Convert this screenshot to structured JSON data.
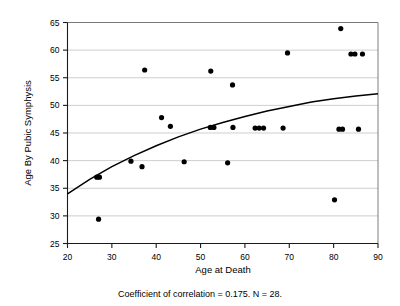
{
  "chart_data": {
    "type": "scatter",
    "title": "",
    "xlabel": "Age at Death",
    "ylabel": "Age By Pubic Symphysis",
    "xlim": [
      20,
      90
    ],
    "ylim": [
      25,
      65
    ],
    "xticks": [
      20,
      30,
      40,
      50,
      60,
      70,
      80,
      90
    ],
    "yticks": [
      25,
      30,
      35,
      40,
      45,
      50,
      55,
      60,
      65
    ],
    "xtick_labels": [
      "20",
      "30",
      "40",
      "50",
      "60",
      "70",
      "80",
      "90"
    ],
    "ytick_labels": [
      "25",
      "30",
      "35",
      "40",
      "45",
      "50",
      "55",
      "60",
      "65"
    ],
    "grid": "horizontal",
    "legend": "none",
    "n_points": 28,
    "correlation": 0.175,
    "caption": "Coefficient of correlation = 0.175. N = 28.",
    "points": [
      {
        "x": 26.6,
        "y": 37.0
      },
      {
        "x": 27.2,
        "y": 37.0
      },
      {
        "x": 27.0,
        "y": 29.4
      },
      {
        "x": 34.3,
        "y": 39.9
      },
      {
        "x": 36.8,
        "y": 38.9
      },
      {
        "x": 37.4,
        "y": 56.4
      },
      {
        "x": 41.2,
        "y": 47.8
      },
      {
        "x": 43.2,
        "y": 46.2
      },
      {
        "x": 46.3,
        "y": 39.8
      },
      {
        "x": 52.3,
        "y": 56.2
      },
      {
        "x": 52.2,
        "y": 46.0
      },
      {
        "x": 53.0,
        "y": 46.0
      },
      {
        "x": 56.1,
        "y": 39.6
      },
      {
        "x": 57.2,
        "y": 53.7
      },
      {
        "x": 57.3,
        "y": 46.0
      },
      {
        "x": 62.3,
        "y": 45.9
      },
      {
        "x": 63.2,
        "y": 45.9
      },
      {
        "x": 64.2,
        "y": 45.9
      },
      {
        "x": 68.6,
        "y": 45.9
      },
      {
        "x": 69.6,
        "y": 59.5
      },
      {
        "x": 80.2,
        "y": 32.9
      },
      {
        "x": 81.2,
        "y": 45.7
      },
      {
        "x": 82.0,
        "y": 45.7
      },
      {
        "x": 81.6,
        "y": 63.9
      },
      {
        "x": 83.9,
        "y": 59.3
      },
      {
        "x": 84.8,
        "y": 59.3
      },
      {
        "x": 85.6,
        "y": 45.7
      },
      {
        "x": 86.5,
        "y": 59.3
      }
    ],
    "fit_curve": {
      "kind": "logarithmic",
      "description": "fitted regression curve",
      "x": [
        20,
        25,
        30,
        35,
        40,
        45,
        50,
        55,
        60,
        65,
        70,
        75,
        80,
        85,
        90
      ],
      "y": [
        34.0,
        36.6,
        38.9,
        40.9,
        42.7,
        44.3,
        45.7,
        46.9,
        48.0,
        49.0,
        49.8,
        50.6,
        51.2,
        51.7,
        52.1
      ]
    }
  },
  "colors": {
    "point": "#000000",
    "grid": "#b9b9b9",
    "axis": "#1a1a1a",
    "frame": "#6f6f6f",
    "background": "#ffffff"
  }
}
